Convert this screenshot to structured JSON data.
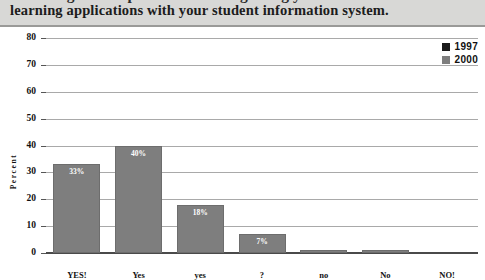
{
  "header": {
    "clipped_line": "knowledge of the potential for integrating your",
    "main_line": "learning applications with your student information system.",
    "band_color": "#d8d8d6"
  },
  "legend": {
    "position": "top-right",
    "entries": [
      {
        "label": "1997",
        "color": "#1a1a1a"
      },
      {
        "label": "2000",
        "color": "#7e7e7e"
      }
    ]
  },
  "chart_data": {
    "type": "bar",
    "title": "",
    "xlabel": "",
    "ylabel": "Percent",
    "ylim": [
      0,
      80
    ],
    "ytick_labels": [
      "0",
      "10",
      "20",
      "30",
      "40",
      "50",
      "60",
      "70",
      "80"
    ],
    "yticks": [
      0,
      10,
      20,
      30,
      40,
      50,
      60,
      70,
      80
    ],
    "grid": true,
    "legend_position": "top-right",
    "categories": [
      "YES!",
      "Yes",
      "yes",
      "?",
      "no",
      "No",
      "NO!"
    ],
    "series": [
      {
        "name": "2000",
        "color": "#7e7e7e",
        "values": [
          33,
          40,
          18,
          7,
          1,
          1,
          0
        ],
        "data_labels": [
          "33%",
          "40%",
          "18%",
          "7%",
          "1%",
          "1%",
          ""
        ]
      }
    ]
  }
}
